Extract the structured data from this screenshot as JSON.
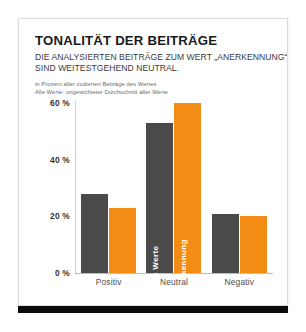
{
  "card": {
    "title": "TONALITÄT DER BEITRÄGE",
    "subtitle_line1": "DIE ANALYSIERTEN BEITRÄGE ZUM WERT „ANERKENNUNG“",
    "subtitle_line2": "SIND WEITESTGEHEND NEUTRAL.",
    "note_line1": "in Prozent aller codierten Beiträge des Wertes",
    "note_line2": "Alle Werte: ungewichteter Durchschnitt aller Werte"
  },
  "colors": {
    "series_alle_werte": "#4a4a4a",
    "series_anerkennung": "#F28C14",
    "footer_bar": "#0b0b0b",
    "card_border": "#dcdcdc"
  },
  "chart_data": {
    "type": "bar",
    "title": "TONALITÄT DER BEITRÄGE",
    "subtitle": "DIE ANALYSIERTEN BEITRÄGE ZUM WERT „ANERKENNUNG“ SIND WEITESTGEHEND NEUTRAL.",
    "xlabel": "",
    "ylabel": "",
    "ylim": [
      0,
      60
    ],
    "grid": false,
    "legend_position": "in-bar",
    "yticks": [
      0,
      20,
      40,
      60
    ],
    "ytick_labels": [
      "0 %",
      "20 %",
      "40 %",
      "60 %"
    ],
    "categories": [
      "Positiv",
      "Neutral",
      "Negativ"
    ],
    "series": [
      {
        "name": "Alle Werte",
        "color": "#4a4a4a",
        "values": [
          28,
          53,
          21
        ]
      },
      {
        "name": "Anerkennung",
        "color": "#F28C14",
        "values": [
          23,
          60,
          20
        ]
      }
    ],
    "annotations": [
      {
        "text": "Alle Werte",
        "on": "Neutral/Alle Werte bar",
        "orientation": "vertical"
      },
      {
        "text": "Anerkennung",
        "on": "Neutral/Anerkennung bar",
        "orientation": "vertical"
      }
    ]
  }
}
